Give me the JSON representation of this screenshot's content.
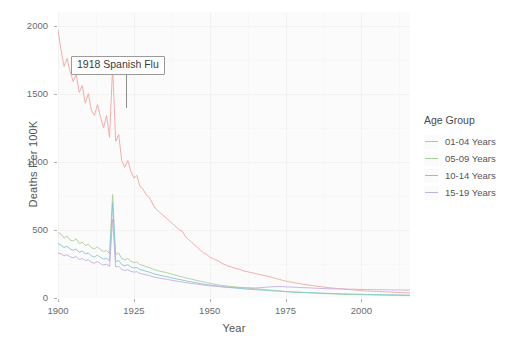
{
  "chart_data": {
    "type": "line",
    "title": "",
    "xlabel": "Year",
    "ylabel": "Deaths Per 100K",
    "xlim": [
      1900,
      2016
    ],
    "ylim": [
      0,
      2100
    ],
    "xticks": [
      "1900",
      "1925",
      "1950",
      "1975",
      "2000"
    ],
    "xtick_values": [
      1900,
      1925,
      1950,
      1975,
      2000
    ],
    "yticks": [
      "0",
      "500",
      "1000",
      "1500",
      "2000"
    ],
    "ytick_values": [
      0,
      500,
      1000,
      1500,
      2000
    ],
    "grid": true,
    "legend_position": "right",
    "legend_title": "Age Group",
    "annotations": [
      {
        "text": "1918 Spanish Flu",
        "x": 1918,
        "y": 1680
      }
    ],
    "x": [
      1900,
      1901,
      1902,
      1903,
      1904,
      1905,
      1906,
      1907,
      1908,
      1909,
      1910,
      1911,
      1912,
      1913,
      1914,
      1915,
      1916,
      1917,
      1918,
      1919,
      1920,
      1921,
      1922,
      1923,
      1924,
      1925,
      1926,
      1927,
      1928,
      1929,
      1930,
      1931,
      1932,
      1933,
      1934,
      1935,
      1936,
      1937,
      1938,
      1939,
      1940,
      1941,
      1942,
      1943,
      1944,
      1945,
      1946,
      1947,
      1948,
      1949,
      1950,
      1951,
      1952,
      1953,
      1954,
      1955,
      1956,
      1957,
      1958,
      1959,
      1960,
      1961,
      1962,
      1963,
      1964,
      1965,
      1966,
      1967,
      1968,
      1969,
      1970,
      1971,
      1972,
      1973,
      1974,
      1975,
      1976,
      1977,
      1978,
      1979,
      1980,
      1981,
      1982,
      1983,
      1984,
      1985,
      1986,
      1987,
      1988,
      1989,
      1990,
      1991,
      1992,
      1993,
      1994,
      1995,
      1996,
      1997,
      1998,
      1999,
      2000,
      2001,
      2002,
      2003,
      2004,
      2005,
      2006,
      2007,
      2008,
      2009,
      2010,
      2011,
      2012,
      2013,
      2014,
      2015,
      2016
    ],
    "series": [
      {
        "name": "01-04 Years",
        "color": "#f2a5a0",
        "values": [
          1970,
          1820,
          1700,
          1760,
          1660,
          1590,
          1640,
          1510,
          1560,
          1430,
          1500,
          1380,
          1340,
          1420,
          1330,
          1250,
          1340,
          1180,
          1700,
          1150,
          1200,
          1010,
          960,
          1010,
          930,
          880,
          900,
          820,
          800,
          760,
          740,
          700,
          660,
          640,
          620,
          600,
          580,
          560,
          540,
          520,
          500,
          490,
          450,
          430,
          410,
          390,
          370,
          350,
          330,
          320,
          300,
          290,
          280,
          270,
          255,
          245,
          235,
          230,
          220,
          215,
          210,
          200,
          195,
          190,
          185,
          180,
          175,
          170,
          165,
          160,
          155,
          148,
          142,
          136,
          130,
          125,
          120,
          116,
          112,
          108,
          104,
          100,
          97,
          94,
          91,
          88,
          85,
          82,
          79,
          76,
          74,
          72,
          70,
          68,
          66,
          64,
          62,
          60,
          58,
          56,
          54,
          52,
          51,
          50,
          49,
          48,
          47,
          46,
          45,
          44,
          43,
          42,
          41,
          40,
          39,
          38,
          37
        ]
      },
      {
        "name": "05-09 Years",
        "color": "#a9cf9a",
        "values": [
          480,
          470,
          440,
          455,
          425,
          420,
          435,
          400,
          410,
          385,
          395,
          370,
          360,
          375,
          355,
          340,
          350,
          325,
          760,
          320,
          330,
          290,
          280,
          290,
          270,
          260,
          265,
          245,
          240,
          230,
          225,
          215,
          205,
          200,
          195,
          190,
          185,
          178,
          172,
          166,
          160,
          155,
          148,
          143,
          138,
          133,
          128,
          123,
          118,
          113,
          108,
          104,
          100,
          96,
          93,
          90,
          87,
          84,
          82,
          80,
          78,
          76,
          74,
          72,
          70,
          68,
          66,
          64,
          62,
          60,
          58,
          56,
          54,
          52,
          50,
          48,
          46,
          44,
          43,
          42,
          41,
          40,
          39,
          38,
          37,
          36,
          35,
          34,
          33,
          32,
          31,
          30,
          29,
          28,
          27,
          27,
          26,
          26,
          25,
          25,
          24,
          24,
          23,
          23,
          22,
          22,
          21,
          21,
          20,
          20,
          19,
          19,
          19,
          18,
          18,
          18,
          17
        ]
      },
      {
        "name": "10-14 Years",
        "color": "#7fc7d4",
        "values": [
          400,
          390,
          370,
          380,
          360,
          350,
          360,
          335,
          345,
          325,
          330,
          310,
          300,
          315,
          298,
          285,
          292,
          272,
          700,
          268,
          275,
          245,
          236,
          244,
          228,
          220,
          224,
          208,
          204,
          196,
          190,
          182,
          175,
          170,
          165,
          160,
          156,
          150,
          145,
          140,
          136,
          132,
          126,
          122,
          118,
          114,
          110,
          106,
          102,
          98,
          95,
          92,
          89,
          86,
          83,
          81,
          78,
          76,
          74,
          72,
          70,
          68,
          66,
          64,
          63,
          61,
          60,
          58,
          57,
          55,
          54,
          52,
          51,
          50,
          48,
          47,
          46,
          45,
          44,
          43,
          42,
          41,
          40,
          39,
          38,
          37,
          36,
          35,
          34,
          34,
          33,
          32,
          32,
          31,
          30,
          30,
          29,
          29,
          28,
          28,
          27,
          27,
          26,
          26,
          25,
          25,
          25,
          24,
          24,
          23,
          23,
          23,
          22,
          22,
          22,
          21,
          21
        ]
      },
      {
        "name": "15-19 Years",
        "color": "#c4aee0",
        "values": [
          330,
          325,
          310,
          318,
          302,
          295,
          305,
          282,
          290,
          275,
          280,
          262,
          255,
          268,
          252,
          242,
          248,
          232,
          580,
          228,
          234,
          210,
          202,
          208,
          196,
          190,
          193,
          180,
          176,
          170,
          165,
          158,
          152,
          148,
          144,
          140,
          137,
          132,
          128,
          124,
          121,
          118,
          113,
          110,
          107,
          104,
          101,
          98,
          95,
          92,
          90,
          88,
          86,
          84,
          82,
          80,
          79,
          78,
          77,
          76,
          76,
          75,
          75,
          74,
          74,
          74,
          75,
          76,
          78,
          80,
          82,
          83,
          84,
          84,
          83,
          82,
          81,
          80,
          79,
          78,
          77,
          76,
          75,
          74,
          73,
          72,
          71,
          70,
          69,
          68,
          68,
          67,
          67,
          66,
          66,
          65,
          65,
          64,
          64,
          63,
          63,
          63,
          62,
          62,
          62,
          61,
          61,
          61,
          60,
          60,
          60,
          59,
          59,
          59,
          58,
          58,
          58
        ]
      }
    ]
  }
}
